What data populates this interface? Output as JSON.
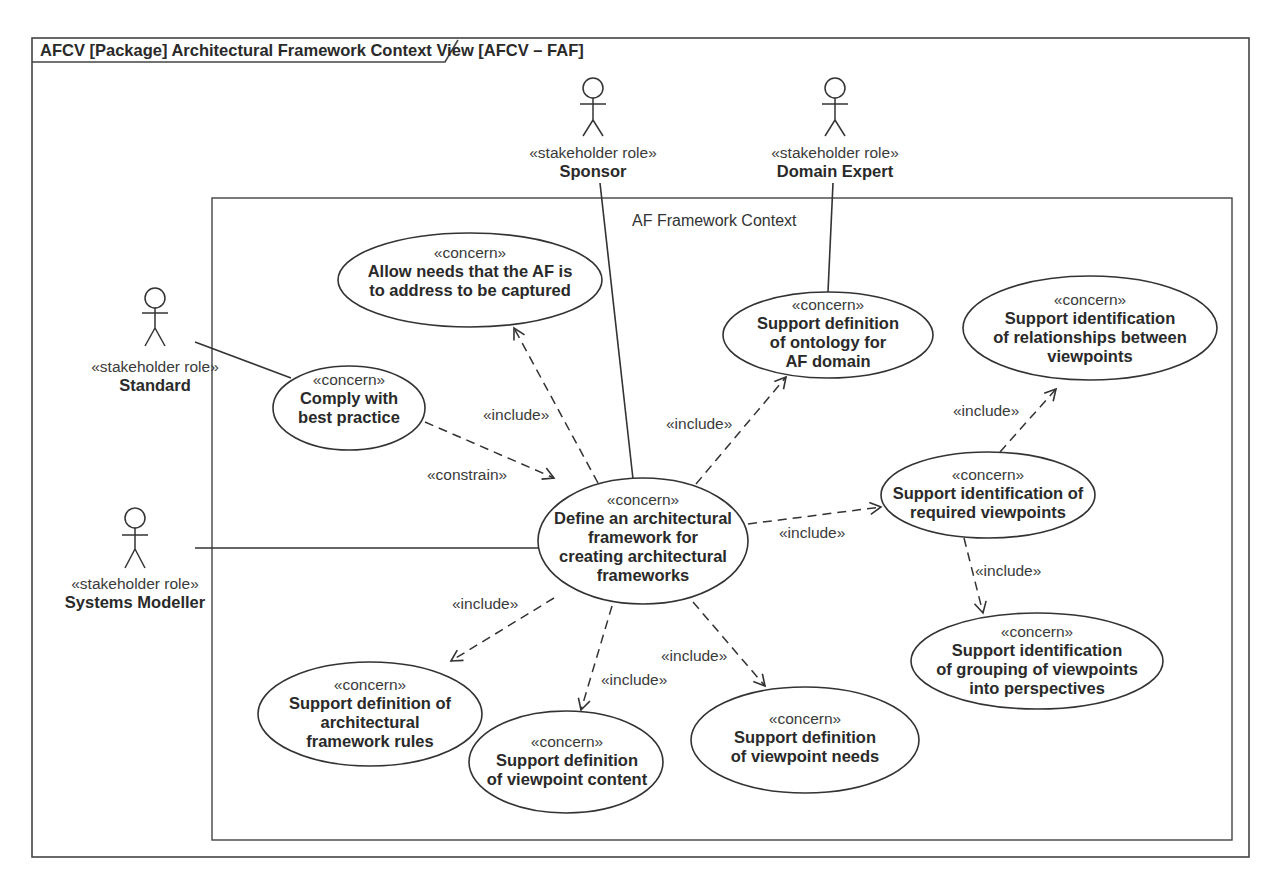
{
  "frame": {
    "title": "AFCV [Package] Architectural Framework Context View [AFCV – FAF]"
  },
  "boundary": {
    "label": "AF Framework Context"
  },
  "actors": [
    {
      "id": "sponsor",
      "stereotype": "«stakeholder role»",
      "name": "Sponsor"
    },
    {
      "id": "domain-expert",
      "stereotype": "«stakeholder role»",
      "name": "Domain Expert"
    },
    {
      "id": "standard",
      "stereotype": "«stakeholder role»",
      "name": "Standard"
    },
    {
      "id": "systems-modeller",
      "stereotype": "«stakeholder role»",
      "name": "Systems Modeller"
    }
  ],
  "concerns": [
    {
      "id": "allow-needs",
      "stereotype": "«concern»",
      "lines": [
        "Allow needs that the AF is",
        "to address to be captured"
      ]
    },
    {
      "id": "comply",
      "stereotype": "«concern»",
      "lines": [
        "Comply with",
        "best practice"
      ]
    },
    {
      "id": "ontology",
      "stereotype": "«concern»",
      "lines": [
        "Support definition",
        "of ontology for",
        "AF domain"
      ]
    },
    {
      "id": "relationships",
      "stereotype": "«concern»",
      "lines": [
        "Support identification",
        "of relationships between",
        "viewpoints"
      ]
    },
    {
      "id": "define-af",
      "stereotype": "«concern»",
      "lines": [
        "Define an architectural",
        "framework for",
        "creating architectural",
        "frameworks"
      ]
    },
    {
      "id": "required-viewpoints",
      "stereotype": "«concern»",
      "lines": [
        "Support identification of",
        "required viewpoints"
      ]
    },
    {
      "id": "grouping",
      "stereotype": "«concern»",
      "lines": [
        "Support identification",
        "of grouping of viewpoints",
        "into perspectives"
      ]
    },
    {
      "id": "rules",
      "stereotype": "«concern»",
      "lines": [
        "Support definition of",
        "architectural",
        "framework rules"
      ]
    },
    {
      "id": "viewpoint-content",
      "stereotype": "«concern»",
      "lines": [
        "Support definition",
        "of viewpoint content"
      ]
    },
    {
      "id": "viewpoint-needs",
      "stereotype": "«concern»",
      "lines": [
        "Support definition",
        "of viewpoint needs"
      ]
    }
  ],
  "relationships": {
    "include_label": "«include»",
    "constrain_label": "«constrain»",
    "list": [
      {
        "from": "define-af",
        "to": "allow-needs",
        "type": "«include»"
      },
      {
        "from": "define-af",
        "to": "ontology",
        "type": "«include»"
      },
      {
        "from": "comply",
        "to": "define-af",
        "type": "«constrain»"
      },
      {
        "from": "define-af",
        "to": "required-viewpoints",
        "type": "«include»"
      },
      {
        "from": "required-viewpoints",
        "to": "relationships",
        "type": "«include»"
      },
      {
        "from": "required-viewpoints",
        "to": "grouping",
        "type": "«include»"
      },
      {
        "from": "define-af",
        "to": "rules",
        "type": "«include»"
      },
      {
        "from": "define-af",
        "to": "viewpoint-content",
        "type": "«include»"
      },
      {
        "from": "define-af",
        "to": "viewpoint-needs",
        "type": "«include»"
      }
    ]
  },
  "associations": [
    {
      "actor": "sponsor",
      "concern": "define-af"
    },
    {
      "actor": "domain-expert",
      "concern": "ontology"
    },
    {
      "actor": "standard",
      "concern": "comply"
    },
    {
      "actor": "systems-modeller",
      "concern": "define-af"
    }
  ]
}
